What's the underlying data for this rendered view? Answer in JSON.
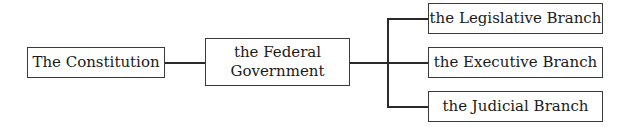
{
  "diagram": {
    "type": "hierarchy",
    "root": {
      "label": "The Constitution"
    },
    "middle": {
      "label_line1": "the Federal",
      "label_line2": "Government"
    },
    "branches": [
      {
        "label": "the Legislative Branch"
      },
      {
        "label": "the Executive Branch"
      },
      {
        "label": "the Judicial Branch"
      }
    ],
    "colors": {
      "line": "#2a2a2a",
      "border": "#3a3a3a",
      "text": "#1a1a1a",
      "background": "#ffffff"
    }
  }
}
